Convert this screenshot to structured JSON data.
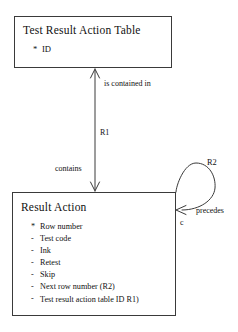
{
  "diagram": {
    "type": "entity-relationship-diagram",
    "entities": [
      {
        "id": "test-result-action-table",
        "title": "Test Result Action Table",
        "attributes": [
          {
            "marker": "*",
            "label": "ID"
          }
        ]
      },
      {
        "id": "result-action",
        "title": "Result Action",
        "attributes": [
          {
            "marker": "*",
            "label": "Row number"
          },
          {
            "marker": "-",
            "label": "Test code"
          },
          {
            "marker": "-",
            "label": "Ink"
          },
          {
            "marker": "-",
            "label": "Retest"
          },
          {
            "marker": "-",
            "label": "Skip"
          },
          {
            "marker": "-",
            "label": "Next row number (R2)"
          },
          {
            "marker": "-",
            "label": "Test result action table ID R1)"
          }
        ]
      }
    ],
    "relationships": [
      {
        "id": "r1",
        "name": "R1",
        "forward_label": "contains",
        "reverse_label": "is contained in"
      },
      {
        "id": "r2",
        "name": "R2",
        "forward_label": "precedes",
        "multiplicity": "c"
      }
    ],
    "colors": {
      "line": "#3a3a3a",
      "text": "#111111",
      "background": "#ffffff"
    }
  }
}
